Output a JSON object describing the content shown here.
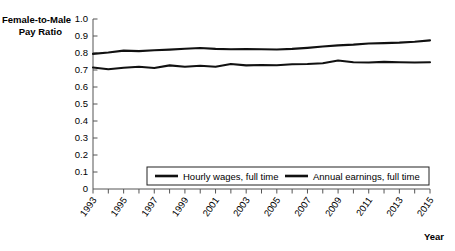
{
  "chart_data": {
    "type": "line",
    "title": "",
    "ylabel": "Female-to-Male Pay Ratio",
    "ylabel_line1": "Female-to-Male",
    "ylabel_line2": "Pay Ratio",
    "xlabel": "Year",
    "ylim": [
      0,
      1.0
    ],
    "xlim": [
      1993,
      2015
    ],
    "grid": false,
    "legend_position": "bottom-center",
    "ytick_labels": [
      "0",
      "0.1",
      "0.2",
      "0.3",
      "0.4",
      "0.5",
      "0.6",
      "0.7",
      "0.8",
      "0.9",
      "1.0"
    ],
    "ytick_values": [
      0,
      0.1,
      0.2,
      0.3,
      0.4,
      0.5,
      0.6,
      0.7,
      0.8,
      0.9,
      1.0
    ],
    "x": [
      1993,
      1994,
      1995,
      1996,
      1997,
      1998,
      1999,
      2000,
      2001,
      2002,
      2003,
      2004,
      2005,
      2006,
      2007,
      2008,
      2009,
      2010,
      2011,
      2012,
      2013,
      2014,
      2015
    ],
    "xtick_labels": [
      "1993",
      "1995",
      "1997",
      "1999",
      "2001",
      "2003",
      "2005",
      "2007",
      "2009",
      "2011",
      "2013",
      "2015"
    ],
    "xtick_label_values": [
      1993,
      1995,
      1997,
      1999,
      2001,
      2003,
      2005,
      2007,
      2009,
      2011,
      2013,
      2015
    ],
    "series": [
      {
        "name": "Hourly wages, full time",
        "color": "#111111",
        "values": [
          0.795,
          0.803,
          0.814,
          0.811,
          0.816,
          0.82,
          0.825,
          0.829,
          0.824,
          0.822,
          0.823,
          0.822,
          0.821,
          0.824,
          0.83,
          0.838,
          0.845,
          0.849,
          0.856,
          0.858,
          0.861,
          0.866,
          0.874
        ]
      },
      {
        "name": "Annual earnings, full time",
        "color": "#111111",
        "values": [
          0.715,
          0.704,
          0.713,
          0.719,
          0.712,
          0.727,
          0.719,
          0.725,
          0.719,
          0.735,
          0.727,
          0.729,
          0.728,
          0.734,
          0.735,
          0.74,
          0.756,
          0.746,
          0.744,
          0.748,
          0.746,
          0.744,
          0.746
        ]
      }
    ]
  },
  "legend": {
    "items": [
      {
        "label": "Hourly wages, full time"
      },
      {
        "label": "Annual earnings, full time"
      }
    ]
  }
}
